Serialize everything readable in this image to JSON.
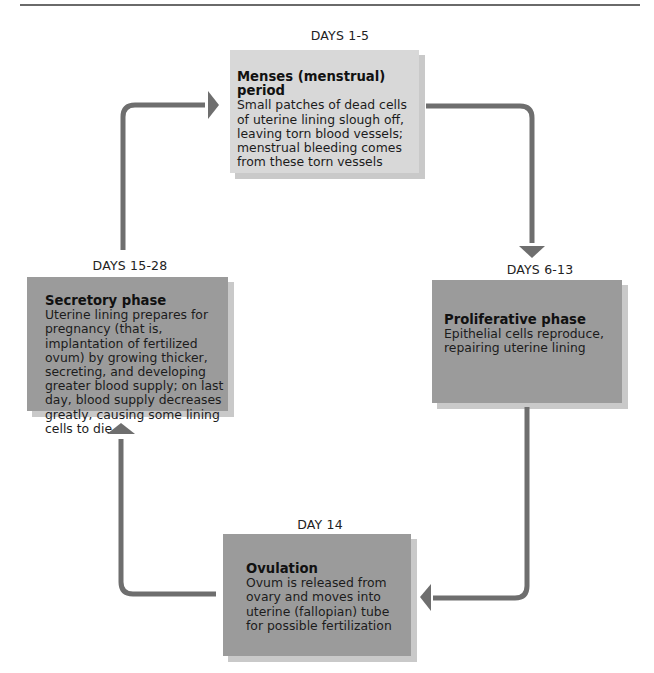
{
  "diagram": {
    "type": "cycle",
    "colors": {
      "top_box_fill": "#d8d8d8",
      "box_fill": "#9b9b9b",
      "box_shadow": "#c9c9c9",
      "arrow": "#6e6e6e",
      "rule": "#6a6a6a"
    },
    "phases": [
      {
        "days": "DAYS 1-5",
        "title": "Menses (menstrual) period",
        "description": "Small patches of dead cells of uterine lining slough off, leaving torn blood vessels; menstrual bleeding comes from these torn vessels"
      },
      {
        "days": "DAYS 6-13",
        "title": "Proliferative phase",
        "description": "Epithelial cells reproduce, repairing uterine lining"
      },
      {
        "days": "DAY 14",
        "title": "Ovulation",
        "description": "Ovum is released from ovary and moves into uterine (fallopian) tube for possible fertilization"
      },
      {
        "days": "DAYS 15-28",
        "title": "Secretory phase",
        "description": "Uterine lining prepares for pregnancy (that is, implantation of fertilized ovum) by growing thicker, secreting, and developing greater blood supply; on last day, blood supply decreases greatly, causing some lining cells to die"
      }
    ],
    "arrows": [
      {
        "from": "Menses (menstrual) period",
        "to": "Proliferative phase",
        "direction": "right-then-down",
        "icon": "arrow-down-icon"
      },
      {
        "from": "Proliferative phase",
        "to": "Ovulation",
        "direction": "down-then-left",
        "icon": "arrow-left-icon"
      },
      {
        "from": "Ovulation",
        "to": "Secretory phase",
        "direction": "left-then-up",
        "icon": "arrow-up-icon"
      },
      {
        "from": "Secretory phase",
        "to": "Menses (menstrual) period",
        "direction": "up-then-right",
        "icon": "arrow-right-icon"
      }
    ]
  }
}
